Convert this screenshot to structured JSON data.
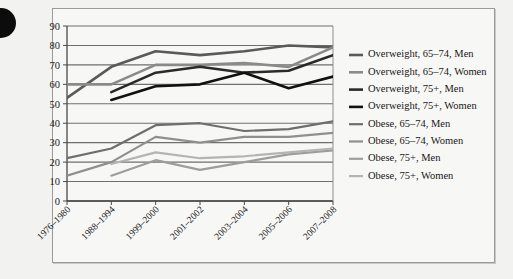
{
  "figure": {
    "bullet_icon": "bullet-point",
    "background_color": "#f2f2f0",
    "panel_color": "#f7f7f6",
    "border_color": "#9a9a98"
  },
  "chart_data": {
    "type": "line",
    "title": "",
    "subtitle": "",
    "xlabel": "",
    "ylabel": "",
    "grid": true,
    "legend_position": "right",
    "ylim": [
      0,
      90
    ],
    "yticks": [
      0,
      10,
      20,
      30,
      40,
      50,
      60,
      70,
      80,
      90
    ],
    "categories": [
      "1976–1980",
      "1988–1994",
      "1999–2000",
      "2001–2002",
      "2003–2004",
      "2005–2006",
      "2007–2008"
    ],
    "series": [
      {
        "name": "Overweight, 65–74, Men",
        "color": "#5a5a5a",
        "width": 2.6,
        "values": [
          53,
          69,
          77,
          75,
          77,
          80,
          79
        ]
      },
      {
        "name": "Overweight, 65–74, Women",
        "color": "#8a8a8a",
        "width": 2.6,
        "values": [
          60,
          60,
          70,
          70,
          71,
          69,
          79
        ]
      },
      {
        "name": "Overweight, 75+, Men",
        "color": "#2a2a2a",
        "width": 2.6,
        "values": [
          null,
          56,
          66,
          69,
          66,
          67,
          75
        ]
      },
      {
        "name": "Overweight, 75+, Women",
        "color": "#111111",
        "width": 2.6,
        "values": [
          null,
          52,
          59,
          60,
          66,
          58,
          64
        ]
      },
      {
        "name": "Obese, 65–74, Men",
        "color": "#6e6e6e",
        "width": 2.2,
        "values": [
          22,
          27,
          39,
          40,
          36,
          37,
          41
        ]
      },
      {
        "name": "Obese, 65–74, Women",
        "color": "#8f8f8f",
        "width": 2.2,
        "values": [
          13,
          20,
          33,
          30,
          33,
          33,
          35
        ]
      },
      {
        "name": "Obese, 75+, Men",
        "color": "#9d9d9d",
        "width": 2.2,
        "values": [
          null,
          13,
          21,
          16,
          20,
          24,
          26
        ]
      },
      {
        "name": "Obese, 75+, Women",
        "color": "#b4b4b4",
        "width": 2.2,
        "values": [
          null,
          19,
          25,
          22,
          23,
          25,
          27
        ]
      }
    ]
  }
}
